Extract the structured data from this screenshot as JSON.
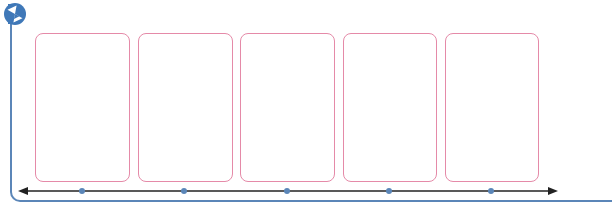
{
  "diagram": {
    "type": "timeline-template",
    "icon": "hourglass-icon",
    "boxes": [
      {
        "x": 35,
        "w": 95
      },
      {
        "x": 138,
        "w": 95
      },
      {
        "x": 240,
        "w": 95
      },
      {
        "x": 343,
        "w": 94
      },
      {
        "x": 445,
        "w": 94
      }
    ],
    "markers_x": [
      82,
      184,
      287,
      389,
      491
    ],
    "colors": {
      "frame": "#5b86b8",
      "box_border": "#e58aa8",
      "axis": "#222222",
      "marker": "#5b86b8"
    }
  }
}
